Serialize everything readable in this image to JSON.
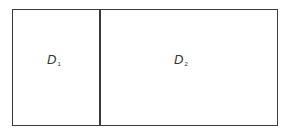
{
  "diagram": {
    "type": "partitioned-rectangle",
    "regions": [
      {
        "id": "region-1",
        "label_main": "D",
        "label_sub": "1"
      },
      {
        "id": "region-2",
        "label_main": "D",
        "label_sub": "2"
      }
    ],
    "stroke_color": "#3a3a3a",
    "background": "#ffffff"
  }
}
